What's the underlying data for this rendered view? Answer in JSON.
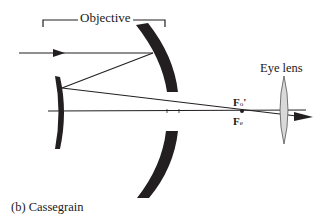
{
  "diagram": {
    "labels": {
      "objective": "Objective",
      "eye_lens": "Eye lens",
      "caption": "(b) Cassegrain",
      "focal_objective": "F",
      "focal_objective_sub": "o",
      "focal_objective_prime": "'",
      "focal_eyepiece": "F",
      "focal_eyepiece_sub": "e"
    },
    "components": [
      {
        "name": "primary-mirror",
        "type": "concave mirror (split)",
        "color": "#231f20"
      },
      {
        "name": "secondary-mirror",
        "type": "convex mirror",
        "color": "#231f20"
      },
      {
        "name": "eye-lens",
        "type": "biconvex lens",
        "color": "#d9d9d9"
      }
    ],
    "rays": [
      {
        "from": "left",
        "to": "primary-mirror",
        "arrow": true
      },
      {
        "from": "primary-mirror",
        "to": "secondary-mirror"
      },
      {
        "from": "secondary-mirror",
        "to": "eye-lens",
        "arrow": true
      }
    ],
    "colors": {
      "ink": "#231f20",
      "lens_fill": "#d9d9d9",
      "background": "#ffffff"
    }
  }
}
